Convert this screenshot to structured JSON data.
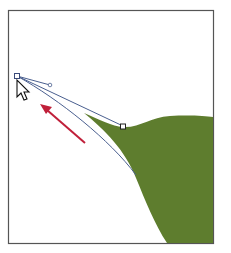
{
  "canvas": {
    "background": "#ffffff",
    "frame_color": "#555555"
  },
  "shape": {
    "name": "green-hill",
    "fill": "#5e7d2e"
  },
  "path": {
    "stroke": "#4a5f8f"
  },
  "anchors": [
    {
      "name": "dragged-anchor",
      "x": 17,
      "y": 76,
      "shape": "square"
    },
    {
      "name": "curve-anchor",
      "x": 123,
      "y": 126,
      "shape": "square"
    }
  ],
  "handle": {
    "x": 50,
    "y": 85
  },
  "arrow": {
    "color": "#c0203a",
    "direction": "up-left"
  },
  "cursor": {
    "type": "direct-selection-arrow",
    "x": 17,
    "y": 80
  }
}
